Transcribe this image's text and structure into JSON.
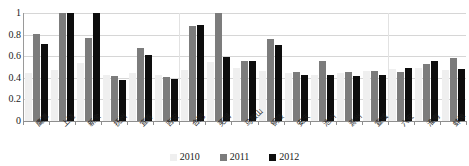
{
  "chart_data": {
    "type": "bar",
    "title": "",
    "subtitle": "",
    "xlabel": "",
    "ylabel": "",
    "ylim": [
      0,
      1
    ],
    "yticks": [
      "0",
      "0.2",
      "0.4",
      "0.6",
      "0.8",
      "1"
    ],
    "ytick_values": [
      0,
      0.2,
      0.4,
      0.6,
      0.8,
      1
    ],
    "grid": true,
    "legend_position": "bottom",
    "categories": [
      "鹰潭",
      "上饶",
      "新余",
      "抚州",
      "宜春",
      "吉安",
      "合肥",
      "芜湖",
      "马鞍山",
      "铜陵",
      "安庆",
      "池州",
      "滁州",
      "宣城",
      "六安",
      "淮南",
      "蚌埠"
    ],
    "series": [
      {
        "name": "2010",
        "color": "#efefef",
        "values": [
          0.44,
          0.47,
          0.54,
          0.43,
          0.44,
          0.43,
          0.47,
          0.55,
          0.49,
          0.46,
          0.44,
          0.43,
          0.44,
          0.46,
          0.48,
          0.49,
          0.47
        ]
      },
      {
        "name": "2011",
        "color": "#7c7c7c",
        "values": [
          0.81,
          1.0,
          0.77,
          0.42,
          0.68,
          0.41,
          0.88,
          1.0,
          0.56,
          0.76,
          0.45,
          0.56,
          0.45,
          0.46,
          0.45,
          0.53,
          0.58
        ]
      },
      {
        "name": "2012",
        "color": "#0d0d0d",
        "values": [
          0.71,
          1.0,
          1.0,
          0.38,
          0.61,
          0.39,
          0.89,
          0.59,
          0.56,
          0.7,
          0.43,
          0.43,
          0.42,
          0.43,
          0.49,
          0.56,
          0.48
        ]
      }
    ]
  },
  "legend": {
    "items": [
      {
        "label": "2010",
        "color": "#efefef"
      },
      {
        "label": "2011",
        "color": "#7c7c7c"
      },
      {
        "label": "2012",
        "color": "#0d0d0d"
      }
    ]
  },
  "group_separators_after": [
    5,
    13
  ]
}
